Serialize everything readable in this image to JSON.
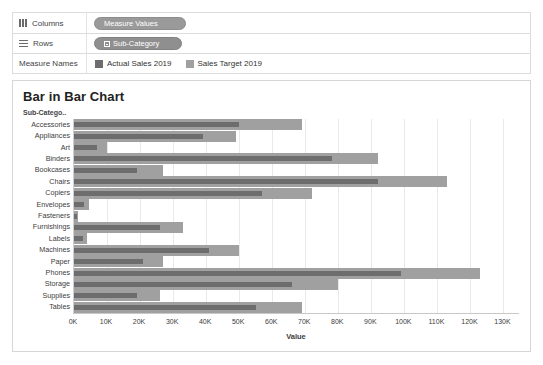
{
  "shelves": {
    "columns": {
      "label": "Columns",
      "pill": "Measure Values",
      "icon": "columns-grid-icon"
    },
    "rows": {
      "label": "Rows",
      "pill": "Sub-Category",
      "icon": "rows-grid-icon"
    }
  },
  "legend": {
    "title": "Measure Names",
    "items": [
      {
        "label": "Actual Sales 2019",
        "color": "#6d6d6d"
      },
      {
        "label": "Sales Target 2019",
        "color": "#a0a0a0"
      }
    ]
  },
  "chart_data": {
    "type": "bar",
    "title": "Bar in Bar Chart",
    "subtype": "bar-in-bar (overlapping horizontal bars)",
    "orientation": "horizontal",
    "xlabel": "Value",
    "ylabel": "Sub-Catego..",
    "ylabel_full": "Sub-Category",
    "xlim": [
      0,
      135000
    ],
    "xticks": [
      0,
      10000,
      20000,
      30000,
      40000,
      50000,
      60000,
      70000,
      80000,
      90000,
      100000,
      110000,
      120000,
      130000
    ],
    "xticklabels": [
      "0K",
      "10K",
      "20K",
      "30K",
      "40K",
      "50K",
      "60K",
      "70K",
      "80K",
      "90K",
      "100K",
      "110K",
      "120K",
      "130K"
    ],
    "grid": true,
    "grid_axis": "x",
    "legend_position": "top",
    "categories": [
      "Accessories",
      "Appliances",
      "Art",
      "Binders",
      "Bookcases",
      "Chairs",
      "Copiers",
      "Envelopes",
      "Fasteners",
      "Furnishings",
      "Labels",
      "Machines",
      "Paper",
      "Phones",
      "Storage",
      "Supplies",
      "Tables"
    ],
    "series": [
      {
        "name": "Sales Target 2019",
        "color": "#a0a0a0",
        "values": [
          69000,
          49000,
          10000,
          92000,
          27000,
          113000,
          72000,
          4500,
          1200,
          33000,
          4000,
          50000,
          27000,
          123000,
          80000,
          26000,
          69000
        ]
      },
      {
        "name": "Actual Sales 2019",
        "color": "#6d6d6d",
        "values": [
          50000,
          39000,
          7000,
          78000,
          19000,
          92000,
          57000,
          3000,
          800,
          26000,
          2800,
          41000,
          21000,
          99000,
          66000,
          19000,
          55000
        ]
      }
    ]
  }
}
